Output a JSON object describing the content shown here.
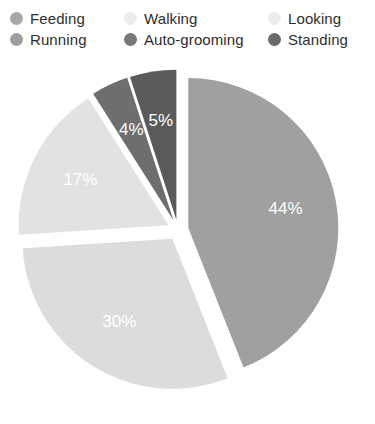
{
  "legend": {
    "columns": [
      {
        "entries": [
          {
            "label": "Feeding",
            "color": "#a8a8a8",
            "swatch_name": "legend-swatch-feeding"
          },
          {
            "label": "Running",
            "color": "#9e9e9e",
            "swatch_name": "legend-swatch-running"
          }
        ]
      },
      {
        "entries": [
          {
            "label": "Walking",
            "color": "#ededed",
            "swatch_name": "legend-swatch-walking"
          },
          {
            "label": "Auto-grooming",
            "color": "#787878",
            "swatch_name": "legend-swatch-auto-grooming"
          }
        ]
      },
      {
        "entries": [
          {
            "label": "Looking",
            "color": "#ececec",
            "swatch_name": "legend-swatch-looking"
          },
          {
            "label": "Standing",
            "color": "#6a6a6a",
            "swatch_name": "legend-swatch-standing"
          }
        ]
      }
    ]
  },
  "chart_data": {
    "type": "pie",
    "title": "",
    "xlabel": "",
    "ylabel": "",
    "grid": false,
    "legend_position": "top",
    "value_unit": "percent",
    "exploded": true,
    "labels": [
      "Feeding",
      "Walking",
      "Looking",
      "Running",
      "Standing"
    ],
    "values": [
      44,
      30,
      17,
      4,
      5
    ],
    "data_labels": [
      "44%",
      "30%",
      "17%",
      "4%",
      "5%"
    ],
    "colors": [
      "#a0a0a0",
      "#dcdcdc",
      "#e2e2e2",
      "#6e6e6e",
      "#5a5a5a"
    ],
    "slices": [
      {
        "label": "Feeding",
        "value": 44,
        "data_label": "44%",
        "color": "#a0a0a0",
        "start_angle": 0,
        "end_angle": 158.4,
        "explode": 0.07
      },
      {
        "label": "Walking",
        "value": 30,
        "data_label": "30%",
        "color": "#dcdcdc",
        "start_angle": 158.4,
        "end_angle": 266.4,
        "explode": 0.07
      },
      {
        "label": "Looking",
        "value": 17,
        "data_label": "17%",
        "color": "#e2e2e2",
        "start_angle": 266.4,
        "end_angle": 327.6,
        "explode": 0.07
      },
      {
        "label": "Running",
        "value": 4,
        "data_label": "4%",
        "color": "#6e6e6e",
        "start_angle": 327.6,
        "end_angle": 342.0,
        "explode": 0.07
      },
      {
        "label": "Standing",
        "value": 5,
        "data_label": "5%",
        "color": "#5a5a5a",
        "start_angle": 342.0,
        "end_angle": 360.0,
        "explode": 0.07
      }
    ],
    "geometry": {
      "center_x": 178,
      "center_y": 182,
      "radius": 150,
      "label_radius_fraction": 0.66
    }
  }
}
